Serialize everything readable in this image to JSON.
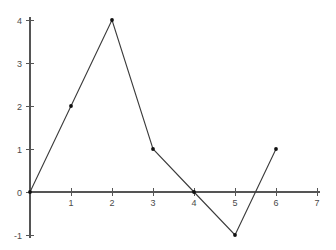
{
  "chart_data": {
    "type": "line",
    "title": "",
    "subtitle": "",
    "xlabel": "",
    "ylabel": "",
    "x": [
      0,
      1,
      2,
      3,
      4,
      5,
      6
    ],
    "values": [
      0,
      2,
      4,
      1,
      0,
      -1,
      1
    ],
    "series": [
      {
        "name": "",
        "x": [
          0,
          1,
          2,
          3,
          4,
          5,
          6
        ],
        "values": [
          0,
          2,
          4,
          1,
          0,
          -1,
          1
        ]
      }
    ],
    "points": [
      {
        "x": 0,
        "y": 0
      },
      {
        "x": 1,
        "y": 2
      },
      {
        "x": 2,
        "y": 4
      },
      {
        "x": 3,
        "y": 1
      },
      {
        "x": 4,
        "y": 0
      },
      {
        "x": 5,
        "y": -1
      },
      {
        "x": 6,
        "y": 1
      }
    ],
    "xlim": [
      0,
      7
    ],
    "ylim": [
      -1,
      4
    ],
    "xticks": [
      0,
      1,
      2,
      3,
      4,
      5,
      6,
      7
    ],
    "yticks": [
      -1,
      0,
      1,
      2,
      3,
      4
    ],
    "xtick_labels": [
      "0",
      "1",
      "2",
      "3",
      "4",
      "5",
      "6",
      "7"
    ],
    "ytick_labels": [
      "-1",
      "0",
      "1",
      "2",
      "3",
      "4"
    ],
    "grid": false,
    "legend": false,
    "legend_position": "none",
    "markers": "dot",
    "line_color": "#3b3b3b",
    "marker_color": "#101010",
    "axis_color": "#555555",
    "tick_label_color": "#4a4a4a",
    "background_color": "#ffffff",
    "annotations": []
  },
  "axes": {
    "x_axis_name": "x-axis",
    "y_axis_name": "y-axis",
    "origin_label": "0"
  }
}
